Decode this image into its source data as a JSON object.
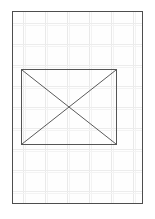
{
  "canvas": {
    "width": 155,
    "height": 219,
    "background_color": "#ffffff"
  },
  "page": {
    "label": "document page",
    "border_color": "#4d4d4d",
    "background_color": "#fefefe",
    "x": 12,
    "y": 11,
    "width": 131,
    "height": 193
  },
  "grid": {
    "label": "ruled grid",
    "line_color": "#e9e9e9",
    "soft_line_color": "#f3f3f3",
    "vertical_positions": [
      10,
      32,
      54,
      76,
      98,
      120
    ],
    "horizontal_positions": [
      11,
      32,
      53,
      74,
      95,
      116,
      137,
      158,
      179
    ],
    "vertical_soft_offset": 2,
    "horizontal_soft_offset": 2
  },
  "placeholder": {
    "label": "missing image placeholder",
    "border_color": "#555555",
    "diagonal_color": "#5a5a5a",
    "diagonal_width": 1,
    "x": 8,
    "y": 57,
    "width": 96,
    "height": 76
  }
}
